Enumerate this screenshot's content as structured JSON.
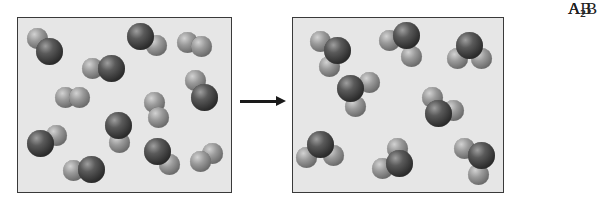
{
  "figure": {
    "colors": {
      "box_fill": "#e6e6e6",
      "box_border": "#3a3a3a",
      "atom_A": "#8a8a8a",
      "atom_B": "#2e2e2e",
      "arrow": "#1a1a1a"
    }
  },
  "reactants_box": {
    "molecules": [
      {
        "type": "AB",
        "atoms": [
          {
            "el": "a",
            "x": 37,
            "y": 38
          },
          {
            "el": "b",
            "x": 49,
            "y": 51
          }
        ]
      },
      {
        "type": "AB",
        "atoms": [
          {
            "el": "b",
            "x": 140,
            "y": 36
          },
          {
            "el": "a",
            "x": 156,
            "y": 45
          }
        ]
      },
      {
        "type": "A2",
        "atoms": [
          {
            "el": "a",
            "x": 187,
            "y": 42
          },
          {
            "el": "a",
            "x": 201,
            "y": 46
          }
        ]
      },
      {
        "type": "AB",
        "atoms": [
          {
            "el": "a",
            "x": 92,
            "y": 68
          },
          {
            "el": "b",
            "x": 111,
            "y": 68
          }
        ]
      },
      {
        "type": "A2",
        "atoms": [
          {
            "el": "a",
            "x": 65,
            "y": 97
          },
          {
            "el": "a",
            "x": 79,
            "y": 97
          }
        ]
      },
      {
        "type": "AB",
        "atoms": [
          {
            "el": "a",
            "x": 195,
            "y": 80
          },
          {
            "el": "b",
            "x": 204,
            "y": 97
          }
        ]
      },
      {
        "type": "A2",
        "atoms": [
          {
            "el": "a",
            "x": 154,
            "y": 102
          },
          {
            "el": "a",
            "x": 158,
            "y": 117
          }
        ]
      },
      {
        "type": "AB",
        "atoms": [
          {
            "el": "a",
            "x": 119,
            "y": 142
          },
          {
            "el": "b",
            "x": 118,
            "y": 125
          }
        ]
      },
      {
        "type": "AB",
        "atoms": [
          {
            "el": "a",
            "x": 56,
            "y": 135
          },
          {
            "el": "b",
            "x": 40,
            "y": 143
          }
        ]
      },
      {
        "type": "AB",
        "atoms": [
          {
            "el": "a",
            "x": 169,
            "y": 164
          },
          {
            "el": "b",
            "x": 157,
            "y": 151
          }
        ]
      },
      {
        "type": "A2",
        "atoms": [
          {
            "el": "a",
            "x": 212,
            "y": 153
          },
          {
            "el": "a",
            "x": 200,
            "y": 161
          }
        ]
      },
      {
        "type": "AB",
        "atoms": [
          {
            "el": "a",
            "x": 73,
            "y": 170
          },
          {
            "el": "b",
            "x": 91,
            "y": 169
          }
        ]
      }
    ]
  },
  "arrow": {
    "label": "",
    "direction": "right"
  },
  "products_box": {
    "molecules": [
      {
        "type": "A2B",
        "atoms": [
          {
            "el": "a",
            "x": 320,
            "y": 41
          },
          {
            "el": "a",
            "x": 329,
            "y": 66
          },
          {
            "el": "b",
            "x": 337,
            "y": 50
          }
        ]
      },
      {
        "type": "A2B",
        "atoms": [
          {
            "el": "a",
            "x": 389,
            "y": 40
          },
          {
            "el": "a",
            "x": 411,
            "y": 56
          },
          {
            "el": "b",
            "x": 406,
            "y": 35
          }
        ]
      },
      {
        "type": "A2B",
        "atoms": [
          {
            "el": "a",
            "x": 457,
            "y": 58
          },
          {
            "el": "a",
            "x": 481,
            "y": 58
          },
          {
            "el": "b",
            "x": 469,
            "y": 45
          }
        ]
      },
      {
        "type": "A2B",
        "atoms": [
          {
            "el": "a",
            "x": 369,
            "y": 82
          },
          {
            "el": "a",
            "x": 355,
            "y": 106
          },
          {
            "el": "b",
            "x": 350,
            "y": 88
          }
        ]
      },
      {
        "type": "A2B",
        "atoms": [
          {
            "el": "a",
            "x": 432,
            "y": 97
          },
          {
            "el": "a",
            "x": 453,
            "y": 110
          },
          {
            "el": "b",
            "x": 438,
            "y": 113
          }
        ]
      },
      {
        "type": "A2B",
        "atoms": [
          {
            "el": "a",
            "x": 306,
            "y": 157
          },
          {
            "el": "a",
            "x": 333,
            "y": 155
          },
          {
            "el": "b",
            "x": 320,
            "y": 144
          }
        ]
      },
      {
        "type": "A2B",
        "atoms": [
          {
            "el": "a",
            "x": 397,
            "y": 148
          },
          {
            "el": "a",
            "x": 382,
            "y": 168
          },
          {
            "el": "b",
            "x": 399,
            "y": 163
          }
        ]
      },
      {
        "type": "A2B",
        "atoms": [
          {
            "el": "a",
            "x": 464,
            "y": 148
          },
          {
            "el": "a",
            "x": 478,
            "y": 174
          },
          {
            "el": "b",
            "x": 481,
            "y": 155
          }
        ]
      }
    ]
  },
  "legend": [
    {
      "key": "A2",
      "label_main": "A",
      "label_sub": "2",
      "label_tail": "",
      "label_y": 28,
      "atoms": [
        {
          "el": "a",
          "x": 527,
          "y": 35
        },
        {
          "el": "a",
          "x": 541,
          "y": 35
        }
      ]
    },
    {
      "key": "AB",
      "label_main": "AB",
      "label_sub": "",
      "label_tail": "",
      "label_y": 62,
      "atoms": [
        {
          "el": "a",
          "x": 526,
          "y": 70
        },
        {
          "el": "b",
          "x": 542,
          "y": 70
        }
      ]
    },
    {
      "key": "A2B",
      "label_main": "A",
      "label_sub": "2",
      "label_tail": "B",
      "label_y": 95,
      "atoms": [
        {
          "el": "a",
          "x": 527,
          "y": 118
        },
        {
          "el": "a",
          "x": 552,
          "y": 118
        },
        {
          "el": "b",
          "x": 540,
          "y": 103
        }
      ]
    }
  ]
}
